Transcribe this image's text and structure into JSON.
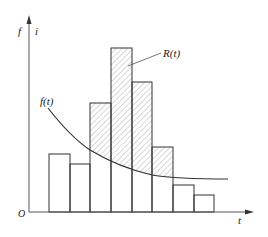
{
  "diagram": {
    "type": "histogram-with-curve",
    "axes": {
      "origin_label": "O",
      "x_label": "t",
      "y_label_left": "f",
      "y_label_right": "i"
    },
    "labels": {
      "curve": "f(t)",
      "hatched_region": "R(t)"
    },
    "colors": {
      "stroke": "#333333",
      "hatch": "#9a9a9a",
      "background": "#ffffff"
    }
  },
  "chart_data": {
    "type": "bar",
    "title": "",
    "xlabel": "t",
    "ylabel": "f / i",
    "categories": [
      "1",
      "2",
      "3",
      "4",
      "5",
      "6",
      "7",
      "8"
    ],
    "series": [
      {
        "name": "histogram bar height (px above baseline)",
        "values": [
          58,
          48,
          109,
          164,
          130,
          65,
          27,
          17
        ]
      },
      {
        "name": "f(t) curve value at bar (px above baseline)",
        "values": [
          null,
          null,
          62,
          50,
          40,
          33,
          30,
          29
        ]
      }
    ],
    "annotations": [
      "f(t)",
      "R(t)"
    ],
    "grid": false
  },
  "geometry": {
    "baseline_y": 212,
    "axis_x": 29,
    "bars": [
      {
        "x": 49,
        "w": 21,
        "top": 154,
        "hatched": false
      },
      {
        "x": 70,
        "w": 20,
        "top": 164,
        "hatched": false
      },
      {
        "x": 90,
        "w": 21,
        "top": 103,
        "hatched": true
      },
      {
        "x": 111,
        "w": 21,
        "top": 48,
        "hatched": true
      },
      {
        "x": 132,
        "w": 20,
        "top": 82,
        "hatched": true
      },
      {
        "x": 152,
        "w": 21,
        "top": 147,
        "hatched": true
      },
      {
        "x": 173,
        "w": 21,
        "top": 185,
        "hatched": false
      },
      {
        "x": 194,
        "w": 20,
        "top": 195,
        "hatched": false
      }
    ]
  }
}
